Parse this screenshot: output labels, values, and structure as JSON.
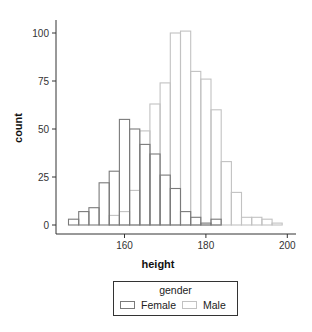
{
  "chart_data": {
    "type": "bar",
    "subtype": "overlapping-histogram",
    "title": "",
    "xlabel": "height",
    "ylabel": "count",
    "xlim": [
      143,
      202
    ],
    "ylim": [
      0,
      105
    ],
    "bin_width": 2.5,
    "bin_start": 146.25,
    "x_ticks": [
      160,
      180,
      200
    ],
    "y_ticks": [
      0,
      25,
      50,
      75,
      100
    ],
    "grid": false,
    "legend_position": "bottom",
    "legend_title": "gender",
    "categories": [
      147.5,
      150,
      152.5,
      155,
      157.5,
      160,
      162.5,
      165,
      167.5,
      170,
      172.5,
      175,
      177.5,
      180,
      182.5,
      185,
      187.5,
      190,
      192.5,
      195,
      197.5
    ],
    "series": [
      {
        "name": "Female",
        "color": "#7a7a7a",
        "values": [
          3,
          7,
          9,
          22,
          28,
          55,
          50,
          42,
          37,
          26,
          19,
          7,
          4,
          1,
          3,
          0,
          0,
          0,
          0,
          0,
          0
        ]
      },
      {
        "name": "Male",
        "color": "#c2c2c2",
        "values": [
          0,
          0,
          0,
          0,
          5,
          7,
          18,
          49,
          63,
          74,
          100,
          101,
          80,
          76,
          60,
          33,
          17,
          4,
          4,
          3,
          1
        ]
      }
    ]
  },
  "legend": {
    "title": "gender",
    "items": [
      {
        "label": "Female",
        "color": "#7a7a7a"
      },
      {
        "label": "Male",
        "color": "#c2c2c2"
      }
    ]
  }
}
